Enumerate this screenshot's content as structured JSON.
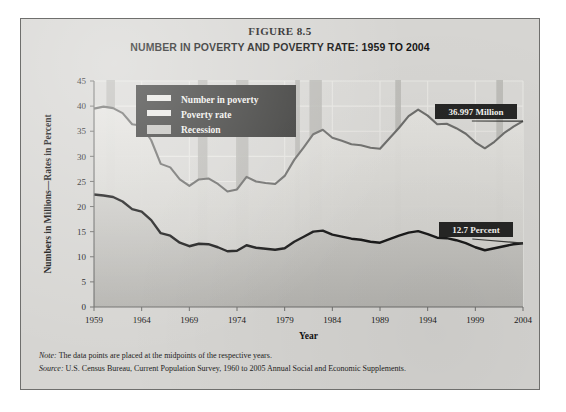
{
  "figure": {
    "number_label": "FIGURE 8.5",
    "title": "NUMBER IN POVERTY AND POVERTY RATE: 1959 TO 2004"
  },
  "notes": {
    "note_label": "Note:",
    "note_text": " The data points are placed at the midpoints of the respective years.",
    "source_label": "Source:",
    "source_text": " U.S. Census Bureau, Current Population Survey, 1960 to 2005 Annual Social and Economic Supplements."
  },
  "legend": {
    "items": [
      {
        "label": "Number in poverty",
        "swatch": "#e9e8e4"
      },
      {
        "label": "Poverty rate",
        "swatch": "#e9e8e4"
      },
      {
        "label": "Recession",
        "swatch": "#c2c1bd"
      }
    ]
  },
  "callouts": [
    {
      "name": "number-in-poverty-endpoint",
      "text": "36.997 Million"
    },
    {
      "name": "poverty-rate-endpoint",
      "text": "12.7 Percent"
    }
  ],
  "colors": {
    "panel_bg": "#d6d5d2",
    "frame": "#6f6f6d",
    "recession_band": "#b9b8b4",
    "number_line": "#6e6e6c",
    "rate_line": "#1b1b1b",
    "legend_bg": "#3a3a38",
    "callout_bg": "#262625",
    "gridline": "#e8e7e3"
  },
  "chart_data": {
    "type": "line",
    "title": "NUMBER IN POVERTY AND POVERTY RATE: 1959 TO 2004",
    "xlabel": "Year",
    "ylabel": "Numbers in Millions—Rates in Percent",
    "xlim": [
      1959,
      2004
    ],
    "ylim": [
      0,
      45
    ],
    "yticks": [
      0,
      5,
      10,
      15,
      20,
      25,
      30,
      35,
      40,
      45
    ],
    "xticks": [
      1959,
      1964,
      1969,
      1974,
      1979,
      1984,
      1989,
      1994,
      1999,
      2004
    ],
    "grid": true,
    "legend_position": "top-center",
    "x": [
      1959,
      1960,
      1961,
      1962,
      1963,
      1964,
      1965,
      1966,
      1967,
      1968,
      1969,
      1970,
      1971,
      1972,
      1973,
      1974,
      1975,
      1976,
      1977,
      1978,
      1979,
      1980,
      1981,
      1982,
      1983,
      1984,
      1985,
      1986,
      1987,
      1988,
      1989,
      1990,
      1991,
      1992,
      1993,
      1994,
      1995,
      1996,
      1997,
      1998,
      1999,
      2000,
      2001,
      2002,
      2003,
      2004
    ],
    "series": [
      {
        "name": "Number in poverty",
        "unit": "millions",
        "color": "#6e6e6c",
        "values": [
          39.5,
          39.9,
          39.6,
          38.6,
          36.4,
          36.1,
          33.2,
          28.5,
          27.8,
          25.4,
          24.1,
          25.4,
          25.6,
          24.5,
          23.0,
          23.4,
          25.9,
          25.0,
          24.7,
          24.5,
          26.1,
          29.3,
          31.8,
          34.4,
          35.3,
          33.7,
          33.1,
          32.4,
          32.2,
          31.7,
          31.5,
          33.6,
          35.7,
          38.0,
          39.3,
          38.1,
          36.4,
          36.5,
          35.6,
          34.5,
          32.8,
          31.6,
          32.9,
          34.6,
          35.9,
          37.0
        ]
      },
      {
        "name": "Poverty rate",
        "unit": "percent",
        "color": "#1b1b1b",
        "values": [
          22.4,
          22.2,
          21.9,
          21.0,
          19.5,
          19.0,
          17.3,
          14.7,
          14.2,
          12.8,
          12.1,
          12.6,
          12.5,
          11.9,
          11.1,
          11.2,
          12.3,
          11.8,
          11.6,
          11.4,
          11.7,
          13.0,
          14.0,
          15.0,
          15.2,
          14.4,
          14.0,
          13.6,
          13.4,
          13.0,
          12.8,
          13.5,
          14.2,
          14.8,
          15.1,
          14.5,
          13.8,
          13.7,
          13.3,
          12.7,
          11.9,
          11.3,
          11.7,
          12.1,
          12.5,
          12.7
        ]
      }
    ],
    "recessions": [
      {
        "start": 1960.3,
        "end": 1961.2
      },
      {
        "start": 1969.9,
        "end": 1970.9
      },
      {
        "start": 1973.9,
        "end": 1975.2
      },
      {
        "start": 1980.1,
        "end": 1980.6
      },
      {
        "start": 1981.6,
        "end": 1982.9
      },
      {
        "start": 1990.6,
        "end": 1991.2
      },
      {
        "start": 2001.2,
        "end": 2001.9
      }
    ],
    "annotations": [
      {
        "series": "Number in poverty",
        "x": 2004,
        "y": 36.997,
        "text": "36.997 Million"
      },
      {
        "series": "Poverty rate",
        "x": 2004,
        "y": 12.7,
        "text": "12.7 Percent"
      }
    ]
  }
}
